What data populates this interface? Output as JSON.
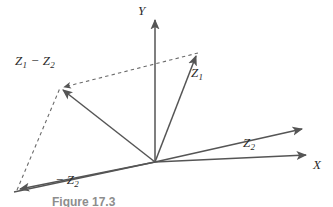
{
  "figure": {
    "caption": "Figure 17.3",
    "background_color": "#ffffff",
    "line_color": "#555555",
    "text_color": "#2b2b2b"
  },
  "axes": {
    "x": {
      "label": "X",
      "label_html": "X"
    },
    "y": {
      "label": "Y",
      "label_html": "Y"
    }
  },
  "vectors": {
    "z1": {
      "label": "Z1",
      "label_html": "Z<sub>1</sub>"
    },
    "z2": {
      "label": "Z2",
      "label_html": "Z<sub>2</sub>"
    },
    "neg_z2": {
      "label": "-Z2",
      "label_html": "&minus;&thinsp;Z<sub>2</sub>"
    },
    "z1_minus_z2": {
      "label": "Z1 - Z2",
      "label_html": "Z<sub>1</sub> &minus; Z<sub>2</sub>"
    }
  },
  "chart_data": {
    "type": "diagram",
    "title": "Figure 17.3",
    "origin": [
      155,
      162
    ],
    "xlabel": "X",
    "ylabel": "Y",
    "axis_segments": [
      {
        "name": "y-axis",
        "from": [
          155,
          162
        ],
        "to": [
          155,
          18
        ],
        "arrow": true,
        "style": "solid"
      },
      {
        "name": "x-axis",
        "from": [
          155,
          162
        ],
        "to": [
          310,
          155
        ],
        "arrow": true,
        "style": "solid"
      },
      {
        "name": "x-axis-left",
        "from": [
          155,
          162
        ],
        "to": [
          14,
          192
        ],
        "arrow": false,
        "style": "solid"
      }
    ],
    "vector_segments": [
      {
        "name": "z1",
        "from": [
          155,
          162
        ],
        "to": [
          198,
          53
        ],
        "arrow": true,
        "style": "solid",
        "label": "Z1"
      },
      {
        "name": "z2",
        "from": [
          155,
          162
        ],
        "to": [
          305,
          128
        ],
        "arrow": true,
        "style": "solid",
        "label": "Z2"
      },
      {
        "name": "neg-z2",
        "from": [
          155,
          162
        ],
        "to": [
          17,
          190
        ],
        "arrow": true,
        "style": "solid",
        "label": "-Z2"
      },
      {
        "name": "z1-minus-z2",
        "from": [
          155,
          162
        ],
        "to": [
          60,
          88
        ],
        "arrow": true,
        "style": "solid",
        "label": "Z1 - Z2"
      }
    ],
    "construction_segments": [
      {
        "name": "dashed-z1-to-resultant",
        "from": [
          198,
          53
        ],
        "to": [
          60,
          88
        ],
        "arrow": true,
        "style": "dashed"
      },
      {
        "name": "dashed-negz2-to-resultant",
        "from": [
          17,
          190
        ],
        "to": [
          60,
          88
        ],
        "arrow": false,
        "style": "dashed"
      }
    ],
    "labels": [
      {
        "text": "Y",
        "x": 141,
        "y": 10
      },
      {
        "text": "X",
        "x": 314,
        "y": 163
      },
      {
        "text": "Z1",
        "x": 193,
        "y": 73
      },
      {
        "text": "Z2",
        "x": 246,
        "y": 143
      },
      {
        "text": "-Z2",
        "x": 58,
        "y": 180
      },
      {
        "text": "Z1 - Z2",
        "x": 17,
        "y": 61
      }
    ],
    "grid": false,
    "legend": null
  }
}
